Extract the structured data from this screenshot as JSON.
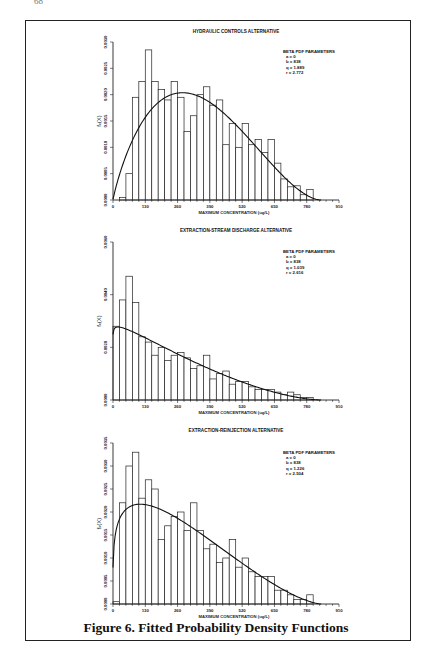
{
  "page": {
    "page_number": "68",
    "running_head": "CHAPTER TITLE TEXT"
  },
  "figure": {
    "caption": "Figure 6.  Fitted Probability Density Functions"
  },
  "chart_data": [
    {
      "type": "bar",
      "title": "HYDRAULIC CONTROLS ALTERNATIVE",
      "xlabel": "MAXIMUM CONCENTRATION (ug/L)",
      "ylabel": "f_x(X)",
      "x_ticks": [
        "0",
        "130",
        "260",
        "390",
        "520",
        "650",
        "780",
        "910"
      ],
      "y_ticks": [
        "0.0000",
        "0.0005",
        "0.0010",
        "0.0015",
        "0.0020",
        "0.0025",
        "0.0030"
      ],
      "xlim": [
        0,
        910
      ],
      "ylim": [
        0,
        0.003
      ],
      "bin_width": 26,
      "bins_start": [
        0,
        26,
        52,
        78,
        104,
        130,
        156,
        182,
        208,
        234,
        260,
        286,
        312,
        338,
        364,
        390,
        416,
        442,
        468,
        494,
        520,
        546,
        572,
        598,
        624,
        650,
        676,
        702,
        728,
        754,
        780
      ],
      "values": [
        0,
        5e-05,
        0.0005,
        0.00195,
        0.00225,
        0.00285,
        0.00225,
        0.0021,
        0.0019,
        0.00225,
        0.00195,
        0.0013,
        0.0016,
        0.002,
        0.00215,
        0.0018,
        0.0019,
        0.00105,
        0.00145,
        0.001,
        0.00145,
        0.00105,
        0.00115,
        0.0009,
        0.00115,
        0.0007,
        0.0004,
        0.00025,
        0.00027,
        0.0001,
        0.0002
      ],
      "legend": {
        "title": "BETA PDF PARAMETERS",
        "lines": [
          "a = 0",
          "b = 838",
          "q = 1.889",
          "r = 2.772"
        ]
      },
      "fit": {
        "a": 0,
        "b": 838,
        "q": 1.889,
        "r": 2.772
      },
      "grid": false
    },
    {
      "type": "bar",
      "title": "EXTRACTION-STREAM DISCHARGE ALTERNATIVE",
      "xlabel": "MAXIMUM CONCENTRATION (ug/L)",
      "ylabel": "f_x(X)",
      "x_ticks": [
        "0",
        "130",
        "260",
        "390",
        "520",
        "650",
        "780",
        "910"
      ],
      "y_ticks": [
        "0.0000",
        "0.0020",
        "0.0040",
        "0.0060"
      ],
      "xlim": [
        0,
        910
      ],
      "ylim": [
        0,
        0.006
      ],
      "bin_width": 26,
      "bins_start": [
        0,
        26,
        52,
        78,
        104,
        130,
        156,
        182,
        208,
        234,
        260,
        286,
        312,
        338,
        364,
        390,
        416,
        442,
        468,
        494,
        520,
        546,
        572,
        598,
        624,
        650,
        676,
        702,
        728,
        754,
        780
      ],
      "values": [
        0.0028,
        0.0038,
        0.0047,
        0.0037,
        0.0024,
        0.0022,
        0.0017,
        0.002,
        0.0015,
        0.0017,
        0.0018,
        0.0016,
        0.0012,
        0.0013,
        0.0017,
        0.0008,
        0.001,
        0.0011,
        0.0006,
        0.0007,
        0.0007,
        0.0005,
        0.0004,
        0.0004,
        0.0004,
        0.0003,
        0.0002,
        0.0003,
        0.0002,
        0.0001,
        0.0001
      ],
      "legend": {
        "title": "BETA PDF PARAMETERS",
        "lines": [
          "a = 0",
          "b = 838",
          "q = 1.039",
          "r = 2.616"
        ]
      },
      "fit": {
        "a": 0,
        "b": 838,
        "q": 1.039,
        "r": 2.616
      },
      "grid": false
    },
    {
      "type": "bar",
      "title": "EXTRACTION-REINJECTION ALTERNATIVE",
      "xlabel": "MAXIMUM CONCENTRATION (ug/L)",
      "ylabel": "f_x(X)",
      "x_ticks": [
        "0",
        "130",
        "260",
        "390",
        "520",
        "650",
        "780",
        "910"
      ],
      "y_ticks": [
        "0.0000",
        "0.0005",
        "0.0010",
        "0.0015",
        "0.0020",
        "0.0025",
        "0.0030",
        "0.0035"
      ],
      "xlim": [
        0,
        910
      ],
      "ylim": [
        0,
        0.0035
      ],
      "bin_width": 26,
      "bins_start": [
        0,
        26,
        52,
        78,
        104,
        130,
        156,
        182,
        208,
        234,
        260,
        286,
        312,
        338,
        364,
        390,
        416,
        442,
        468,
        494,
        520,
        546,
        572,
        598,
        624,
        650,
        676,
        702,
        728,
        754,
        780
      ],
      "values": [
        5e-05,
        0.0022,
        0.003,
        0.0033,
        0.0023,
        0.0027,
        0.0025,
        0.0014,
        0.0017,
        0.0019,
        0.002,
        0.0016,
        0.0022,
        0.0016,
        0.0012,
        0.0013,
        0.0009,
        0.001,
        0.0014,
        0.0008,
        0.001,
        0.0007,
        0.0006,
        0.0006,
        0.0006,
        0.0003,
        0.0003,
        0.0002,
        0.0001,
        0.0001,
        0.0002
      ],
      "legend": {
        "title": "BETA PDF PARAMETERS",
        "lines": [
          "a = 0",
          "b = 838",
          "q = 1.226",
          "r = 2.504"
        ]
      },
      "fit": {
        "a": 0,
        "b": 838,
        "q": 1.226,
        "r": 2.504
      },
      "grid": false
    }
  ]
}
